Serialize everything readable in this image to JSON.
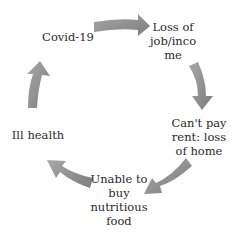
{
  "diagram": {
    "type": "cycle",
    "arrow_color": "#8a8a8a",
    "nodes": [
      {
        "id": "covid",
        "label": "Covid-19"
      },
      {
        "id": "job",
        "label": "Loss of\njob/inco\nme"
      },
      {
        "id": "rent",
        "label": "Can't pay\nrent: loss\nof home"
      },
      {
        "id": "food",
        "label": "Unable to\nbuy\nnutritious\nfood"
      },
      {
        "id": "health",
        "label": "Ill health"
      }
    ],
    "edges": [
      {
        "from": "covid",
        "to": "job"
      },
      {
        "from": "job",
        "to": "rent"
      },
      {
        "from": "rent",
        "to": "food"
      },
      {
        "from": "food",
        "to": "health"
      },
      {
        "from": "health",
        "to": "covid"
      }
    ]
  }
}
